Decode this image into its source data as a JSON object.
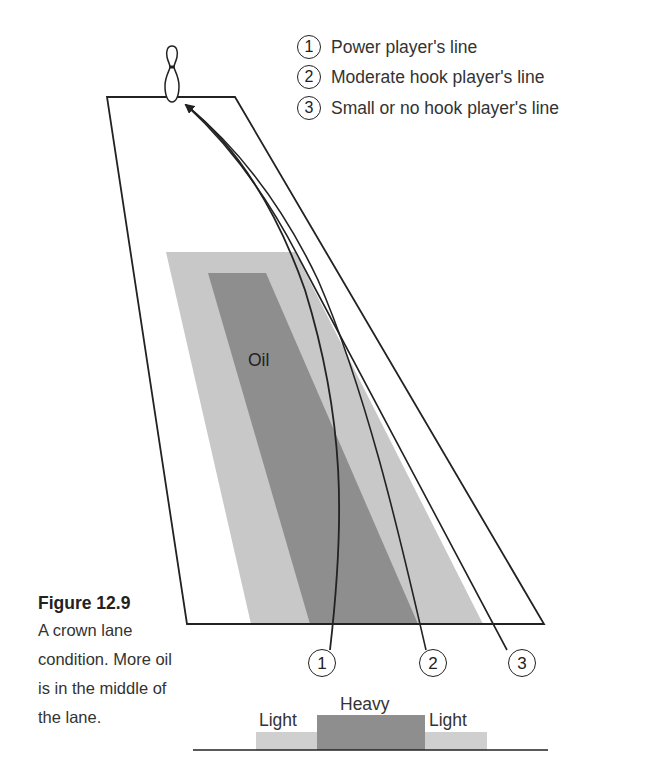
{
  "figure": {
    "caption_title": "Figure 12.9",
    "caption_text": "A crown lane condition. More oil is in the middle of the lane."
  },
  "legend": [
    {
      "number": "1",
      "label": "Power player's line"
    },
    {
      "number": "2",
      "label": "Moderate hook player's line"
    },
    {
      "number": "3",
      "label": "Small or no hook player's line"
    }
  ],
  "lane": {
    "oil_label": "Oil",
    "line_markers": [
      "1",
      "2",
      "3"
    ]
  },
  "profile": {
    "left_label": "Light",
    "center_label": "Heavy",
    "right_label": "Light"
  },
  "colors": {
    "light_oil": "#c8c8c8",
    "heavy_oil": "#8c8c8c",
    "stroke": "#222222"
  },
  "icons": {
    "pin": "bowling-pin-icon"
  }
}
